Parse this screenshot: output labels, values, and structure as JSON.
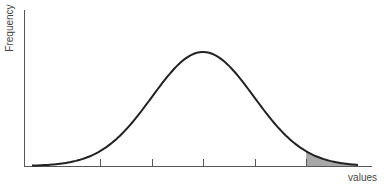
{
  "chart_data": {
    "type": "line",
    "title": "",
    "xlabel": "values",
    "ylabel": "Frequency",
    "distribution": {
      "kind": "normal",
      "mean_px": 203,
      "peak_y_px": 52
    },
    "ticks_px": [
      100,
      152,
      203,
      255,
      306
    ],
    "tick_labels": [],
    "shaded_region": {
      "from_px": 306,
      "to_px": 358,
      "side": "right-tail",
      "color": "#a8a8a8"
    },
    "grid": false,
    "legend": null,
    "colors": {
      "curve": "#222222",
      "axis": "#555555",
      "shade": "#a8a8a8"
    }
  }
}
